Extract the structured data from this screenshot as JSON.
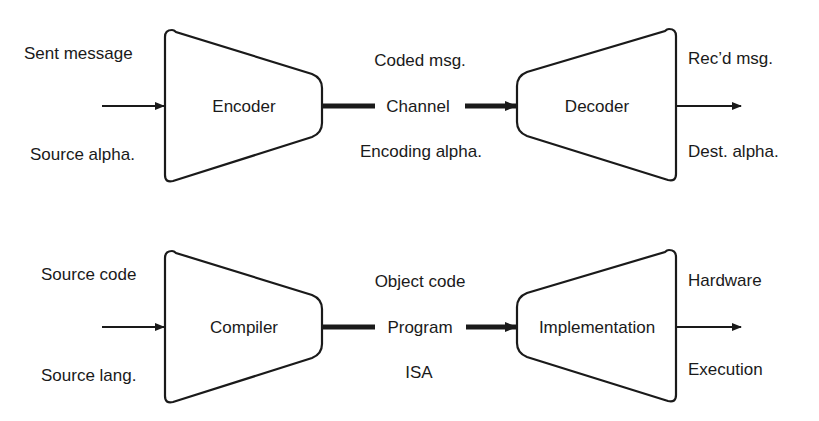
{
  "diagram": {
    "rows": [
      {
        "name": "communication",
        "input": {
          "top_label": "Sent message",
          "bottom_label": "Source alpha."
        },
        "first_block": {
          "label": "Encoder"
        },
        "middle": {
          "top_label": "Coded msg.",
          "center_label": "Channel",
          "bottom_label": "Encoding alpha."
        },
        "second_block": {
          "label": "Decoder"
        },
        "output": {
          "top_label": "Rec’d msg.",
          "bottom_label": "Dest. alpha."
        }
      },
      {
        "name": "computation",
        "input": {
          "top_label": "Source code",
          "bottom_label": "Source lang."
        },
        "first_block": {
          "label": "Compiler"
        },
        "middle": {
          "top_label": "Object code",
          "center_label": "Program",
          "bottom_label": "ISA"
        },
        "second_block": {
          "label": "Implementation"
        },
        "output": {
          "top_label": "Hardware",
          "bottom_label": "Execution"
        }
      }
    ],
    "colors": {
      "stroke": "#1a1a1a",
      "fill": "#ffffff",
      "background": "#ffffff"
    }
  }
}
